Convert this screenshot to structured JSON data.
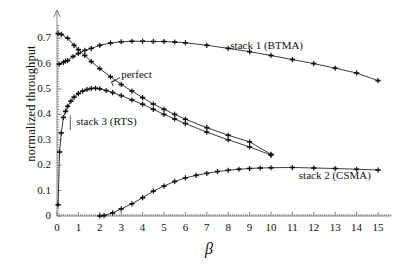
{
  "chart_data": {
    "type": "line",
    "title": "",
    "xlabel": "β",
    "ylabel": "normalized throughput",
    "xlim": [
      0,
      15.6
    ],
    "ylim": [
      0,
      0.75
    ],
    "xticks": [
      0,
      1,
      2,
      3,
      4,
      5,
      6,
      7,
      8,
      9,
      10,
      11,
      12,
      13,
      14,
      15
    ],
    "xticklabels": [
      "0",
      "1",
      "2",
      "3",
      "4",
      "5",
      "6",
      "7",
      "8",
      "9",
      "10",
      "11",
      "12",
      "13",
      "14",
      "15"
    ],
    "yticks": [
      0,
      0.1,
      0.2,
      0.3,
      0.4,
      0.5,
      0.6,
      0.7
    ],
    "yticklabels": [
      "0",
      "0.1",
      "0.2",
      "0.3",
      "0.4",
      "0.5",
      "0.6",
      "0.7"
    ],
    "grid": false,
    "legend_position": "inline-annotations",
    "marker": "plus",
    "series": [
      {
        "name": "stack 1 (BTMA)",
        "label": "stack 1 (BTMA)",
        "label_x": 8.1,
        "label_y": 0.665,
        "color": "#1a1a1a",
        "points": [
          [
            0.1,
            0.598
          ],
          [
            0.3,
            0.605
          ],
          [
            0.4,
            0.61
          ],
          [
            0.5,
            0.612
          ],
          [
            0.75,
            0.628
          ],
          [
            1.0,
            0.64
          ],
          [
            1.3,
            0.652
          ],
          [
            1.6,
            0.66
          ],
          [
            2.0,
            0.672
          ],
          [
            2.5,
            0.681
          ],
          [
            3.0,
            0.686
          ],
          [
            3.5,
            0.688
          ],
          [
            4.0,
            0.688
          ],
          [
            4.5,
            0.687
          ],
          [
            5.0,
            0.687
          ],
          [
            5.5,
            0.685
          ],
          [
            6.0,
            0.682
          ],
          [
            7.0,
            0.672
          ],
          [
            8.0,
            0.66
          ],
          [
            9.0,
            0.647
          ],
          [
            10.0,
            0.632
          ],
          [
            11.0,
            0.616
          ],
          [
            12.0,
            0.6
          ],
          [
            13.0,
            0.582
          ],
          [
            14.0,
            0.563
          ],
          [
            15.0,
            0.533
          ]
        ]
      },
      {
        "name": "perfect",
        "label": "perfect",
        "label_x": 3.0,
        "label_y": 0.552,
        "color": "#1a1a1a",
        "points": [
          [
            0.05,
            0.718
          ],
          [
            0.2,
            0.715
          ],
          [
            0.5,
            0.7
          ],
          [
            0.8,
            0.672
          ],
          [
            1.0,
            0.655
          ],
          [
            1.3,
            0.632
          ],
          [
            1.6,
            0.608
          ],
          [
            2.0,
            0.58
          ],
          [
            2.5,
            0.548
          ],
          [
            3.0,
            0.518
          ],
          [
            3.5,
            0.492
          ],
          [
            4.0,
            0.466
          ],
          [
            4.5,
            0.441
          ],
          [
            5.0,
            0.42
          ],
          [
            5.5,
            0.4
          ],
          [
            6.0,
            0.381
          ],
          [
            7.0,
            0.348
          ],
          [
            8.0,
            0.318
          ],
          [
            9.0,
            0.292
          ],
          [
            10.0,
            0.243
          ]
        ]
      },
      {
        "name": "stack 3 (RTS)",
        "label": "stack 3 (RTS)",
        "label_x": 0.9,
        "label_y": 0.368,
        "color": "#1a1a1a",
        "points": [
          [
            0.05,
            0.044
          ],
          [
            0.12,
            0.252
          ],
          [
            0.2,
            0.327
          ],
          [
            0.3,
            0.388
          ],
          [
            0.4,
            0.412
          ],
          [
            0.5,
            0.432
          ],
          [
            0.65,
            0.452
          ],
          [
            0.8,
            0.468
          ],
          [
            1.0,
            0.482
          ],
          [
            1.2,
            0.492
          ],
          [
            1.4,
            0.498
          ],
          [
            1.6,
            0.502
          ],
          [
            1.8,
            0.503
          ],
          [
            2.0,
            0.501
          ],
          [
            2.3,
            0.494
          ],
          [
            2.6,
            0.486
          ],
          [
            3.0,
            0.474
          ],
          [
            3.5,
            0.457
          ],
          [
            4.0,
            0.44
          ],
          [
            4.5,
            0.42
          ],
          [
            5.0,
            0.4
          ],
          [
            5.5,
            0.382
          ],
          [
            6.0,
            0.364
          ],
          [
            7.0,
            0.33
          ],
          [
            8.0,
            0.3
          ],
          [
            9.0,
            0.272
          ],
          [
            10.0,
            0.24
          ]
        ]
      },
      {
        "name": "stack 2 (CSMA)",
        "label": "stack 2 (CSMA)",
        "label_x": 11.3,
        "label_y": 0.155,
        "color": "#1a1a1a",
        "points": [
          [
            2.0,
            0.0
          ],
          [
            2.2,
            0.002
          ],
          [
            2.6,
            0.012
          ],
          [
            3.0,
            0.028
          ],
          [
            3.5,
            0.048
          ],
          [
            4.0,
            0.072
          ],
          [
            4.5,
            0.098
          ],
          [
            5.0,
            0.118
          ],
          [
            5.5,
            0.136
          ],
          [
            6.0,
            0.15
          ],
          [
            6.5,
            0.16
          ],
          [
            7.0,
            0.168
          ],
          [
            7.5,
            0.175
          ],
          [
            8.0,
            0.18
          ],
          [
            8.5,
            0.184
          ],
          [
            9.0,
            0.187
          ],
          [
            9.5,
            0.189
          ],
          [
            10.0,
            0.19
          ],
          [
            11.0,
            0.191
          ],
          [
            12.0,
            0.189
          ],
          [
            13.0,
            0.187
          ],
          [
            14.0,
            0.184
          ],
          [
            15.0,
            0.181
          ]
        ]
      }
    ],
    "annotations": [
      {
        "text": "perfect",
        "points_to": "perfect-curve"
      },
      {
        "text": "stack 1 (BTMA)",
        "points_to": "btma-curve"
      },
      {
        "text": "stack 2 (CSMA)",
        "points_to": "csma-curve"
      },
      {
        "text": "stack 3 (RTS)",
        "points_to": "rts-curve"
      }
    ]
  }
}
